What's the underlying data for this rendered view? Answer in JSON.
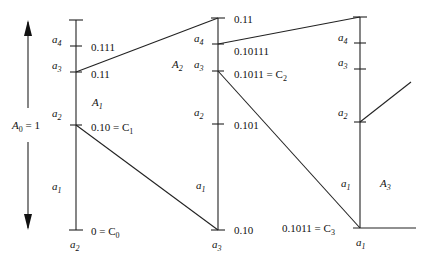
{
  "a0_label": "A",
  "a0_sub": "0",
  "a0_eq": " = 1",
  "columns": [
    {
      "area_label": "A",
      "area_sub": "1",
      "symbols": [
        {
          "name": "a",
          "sub": "4"
        },
        {
          "name": "a",
          "sub": "3"
        },
        {
          "name": "a",
          "sub": "2"
        },
        {
          "name": "a",
          "sub": "1"
        }
      ],
      "values": [
        "0.111",
        "0.11",
        "0.10 = C",
        "0 = C"
      ],
      "value_subs": [
        "",
        "",
        "1",
        "0"
      ],
      "bottom_symbol": {
        "name": "a",
        "sub": "2"
      }
    },
    {
      "area_label": "A",
      "area_sub": "2",
      "symbols": [
        {
          "name": "a",
          "sub": "4"
        },
        {
          "name": "a",
          "sub": "3"
        },
        {
          "name": "a",
          "sub": "2"
        },
        {
          "name": "a",
          "sub": "1"
        }
      ],
      "values": [
        "0.11",
        "0.10111",
        "0.1011 = C",
        "0.101",
        "0.10"
      ],
      "value_subs": [
        "",
        "",
        "2",
        "",
        ""
      ],
      "bottom_symbol": {
        "name": "a",
        "sub": "3"
      }
    },
    {
      "area_label": "A",
      "area_sub": "3",
      "symbols": [
        {
          "name": "a",
          "sub": "4"
        },
        {
          "name": "a",
          "sub": "3"
        },
        {
          "name": "a",
          "sub": "2"
        },
        {
          "name": "a",
          "sub": "1"
        }
      ],
      "values": [
        "0.1011 = C"
      ],
      "value_subs": [
        "3"
      ],
      "bottom_symbol": {
        "name": "a",
        "sub": "1"
      }
    }
  ]
}
